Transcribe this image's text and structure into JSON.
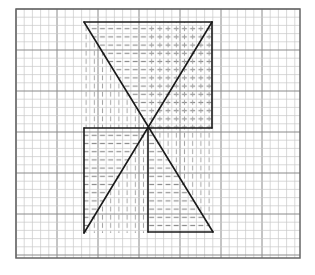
{
  "diagram": {
    "title": "",
    "grid": {
      "left": 16,
      "top": 9,
      "right": 300,
      "bottom": 258,
      "minor_step": 8.2,
      "major_every": 5,
      "minor_color": "#c8c8c8",
      "major_color": "#8a8a8a",
      "border_color": "#666666"
    },
    "figure": {
      "stroke_color": "#1a1a1a",
      "hatch_color": "#9a9a9a",
      "center": [
        148,
        128
      ],
      "vertices": {
        "top_left": [
          84,
          22
        ],
        "top_right": [
          212,
          22
        ],
        "bottom_left": [
          84,
          233
        ],
        "bottom_right": [
          213,
          232
        ]
      },
      "outline_segments": [
        [
          84,
          22,
          212,
          22
        ],
        [
          212,
          22,
          212,
          128
        ],
        [
          84,
          128,
          212,
          128
        ],
        [
          84,
          128,
          84,
          233
        ],
        [
          148,
          128,
          148,
          232
        ],
        [
          148,
          232,
          213,
          232
        ],
        [
          84,
          22,
          213,
          232
        ],
        [
          212,
          22,
          84,
          233
        ]
      ],
      "hatch_regions": [
        {
          "pattern": "horizontal-dashes",
          "polygon": [
            [
              84,
              22
            ],
            [
              212,
              22
            ],
            [
              148,
              128
            ]
          ]
        },
        {
          "pattern": "horizontal-dashes",
          "polygon": [
            [
              148,
              128
            ],
            [
              212,
              22
            ],
            [
              212,
              128
            ]
          ]
        },
        {
          "pattern": "vertical-dashes",
          "polygon": [
            [
              84,
              22
            ],
            [
              148,
              128
            ],
            [
              84,
              128
            ]
          ]
        },
        {
          "pattern": "vertical-dashes",
          "polygon": [
            [
              148,
              22
            ],
            [
              212,
              22
            ],
            [
              212,
              128
            ],
            [
              148,
              128
            ]
          ]
        },
        {
          "pattern": "horizontal-dashes",
          "polygon": [
            [
              84,
              128
            ],
            [
              148,
              128
            ],
            [
              84,
              233
            ]
          ]
        },
        {
          "pattern": "vertical-dashes",
          "polygon": [
            [
              148,
              128
            ],
            [
              84,
              233
            ],
            [
              148,
              233
            ]
          ]
        },
        {
          "pattern": "horizontal-dashes",
          "polygon": [
            [
              148,
              128
            ],
            [
              213,
              232
            ],
            [
              148,
              232
            ]
          ]
        },
        {
          "pattern": "vertical-dashes",
          "polygon": [
            [
              148,
              128
            ],
            [
              213,
              232
            ],
            [
              213,
              128
            ]
          ]
        }
      ]
    }
  }
}
